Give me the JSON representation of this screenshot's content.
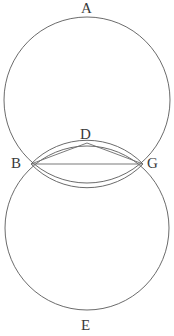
{
  "figure": {
    "background_color": "#ffffff",
    "stroke_color": "#5a5a5a",
    "chord_color": "#6b6b6b",
    "label_color": "#3a3a3a",
    "width": 174,
    "height": 336
  },
  "labels": {
    "a": "A",
    "b": "B",
    "d": "D",
    "e": "E",
    "g": "G"
  },
  "geometry": {
    "circle_top": {
      "cx": 87,
      "cy": 100,
      "r": 83
    },
    "circle_bottom": {
      "cx": 87,
      "cy": 228,
      "r": 82
    },
    "point_b": {
      "x": 31,
      "y": 164
    },
    "point_g": {
      "x": 143,
      "y": 164
    },
    "point_d": {
      "x": 87,
      "y": 143
    },
    "lens_top_apex": {
      "x": 87,
      "y": 143
    },
    "lens_bottom_apex": {
      "x": 87,
      "y": 185
    },
    "lens_arc_radius": 78,
    "segments": [
      {
        "name": "segment-bd",
        "from": "B",
        "to": "D"
      },
      {
        "name": "segment-dg",
        "from": "D",
        "to": "G"
      },
      {
        "name": "segment-bg",
        "from": "B",
        "to": "G"
      }
    ]
  },
  "label_positions": {
    "a": {
      "left": 81,
      "top": 1
    },
    "b": {
      "left": 11,
      "top": 156
    },
    "d": {
      "left": 80,
      "top": 127
    },
    "e": {
      "left": 81,
      "top": 318
    },
    "g": {
      "left": 147,
      "top": 156
    }
  }
}
